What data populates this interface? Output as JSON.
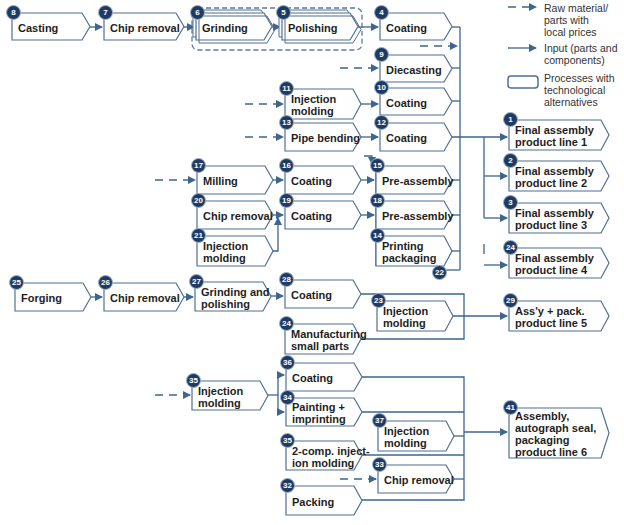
{
  "colors": {
    "line": "#3d6590",
    "badge": "#1f3b63",
    "border": "#4f6f93",
    "dashed_group": "#5a7aa0"
  },
  "legend": {
    "items": [
      {
        "icon": "dashed-arrow-icon",
        "label": "Raw material/\nparts with\nlocal prices"
      },
      {
        "icon": "solid-arrow-icon",
        "label": "Input (parts and\ncomponents)"
      },
      {
        "icon": "double-box-icon",
        "label": "Processes with\ntechnological\nalternatives"
      }
    ]
  },
  "nodes": [
    {
      "id": "n8",
      "num": "8",
      "label": "Casting",
      "x": 12,
      "y": 13,
      "w": 78,
      "h": 27
    },
    {
      "id": "n7",
      "num": "7",
      "label": "Chip removal",
      "x": 104,
      "y": 13,
      "w": 80,
      "h": 27
    },
    {
      "id": "n6",
      "num": "6",
      "label": "Grinding",
      "x": 196,
      "y": 13,
      "w": 76,
      "h": 27,
      "alt": true
    },
    {
      "id": "n5",
      "num": "5",
      "label": "Polishing",
      "x": 282,
      "y": 13,
      "w": 76,
      "h": 27,
      "alt": true
    },
    {
      "id": "n4",
      "num": "4",
      "label": "Coating",
      "x": 380,
      "y": 13,
      "w": 72,
      "h": 27
    },
    {
      "id": "n9",
      "num": "9",
      "label": "Diecasting",
      "x": 380,
      "y": 55,
      "w": 72,
      "h": 27
    },
    {
      "id": "n11",
      "num": "11",
      "label": "Injection\nmolding",
      "x": 285,
      "y": 89,
      "w": 76,
      "h": 30
    },
    {
      "id": "n10",
      "num": "10",
      "label": "Coating",
      "x": 380,
      "y": 88,
      "w": 72,
      "h": 27
    },
    {
      "id": "n13",
      "num": "13",
      "label": "Pipe bending",
      "x": 285,
      "y": 123,
      "w": 76,
      "h": 28
    },
    {
      "id": "n12",
      "num": "12",
      "label": "Coating",
      "x": 380,
      "y": 123,
      "w": 72,
      "h": 28
    },
    {
      "id": "n17",
      "num": "17",
      "label": "Milling",
      "x": 197,
      "y": 166,
      "w": 76,
      "h": 28
    },
    {
      "id": "n16",
      "num": "16",
      "label": "Coating",
      "x": 285,
      "y": 166,
      "w": 76,
      "h": 28
    },
    {
      "id": "n15",
      "num": "15",
      "label": "Pre-assembly",
      "x": 376,
      "y": 166,
      "w": 76,
      "h": 28
    },
    {
      "id": "n20",
      "num": "20",
      "label": "Chip removal",
      "x": 197,
      "y": 201,
      "w": 76,
      "h": 28
    },
    {
      "id": "n19",
      "num": "19",
      "label": "Coating",
      "x": 285,
      "y": 201,
      "w": 76,
      "h": 28
    },
    {
      "id": "n18",
      "num": "18",
      "label": "Pre-assembly",
      "x": 376,
      "y": 201,
      "w": 76,
      "h": 28
    },
    {
      "id": "n21",
      "num": "21",
      "label": "Injection\nmolding",
      "x": 197,
      "y": 236,
      "w": 76,
      "h": 30
    },
    {
      "id": "n14",
      "num": "14",
      "label": "Printing\npackaging",
      "x": 376,
      "y": 236,
      "w": 76,
      "h": 30
    },
    {
      "id": "n25",
      "num": "25",
      "label": "Forging",
      "x": 15,
      "y": 283,
      "w": 76,
      "h": 28
    },
    {
      "id": "n26",
      "num": "26",
      "label": "Chip removal",
      "x": 104,
      "y": 283,
      "w": 80,
      "h": 28
    },
    {
      "id": "n27",
      "num": "27",
      "label": "Grinding and\npolishing",
      "x": 195,
      "y": 282,
      "w": 76,
      "h": 29
    },
    {
      "id": "n28",
      "num": "28",
      "label": "Coating",
      "x": 285,
      "y": 280,
      "w": 76,
      "h": 28
    },
    {
      "id": "n23",
      "num": "23",
      "label": "Injection\nmolding",
      "x": 377,
      "y": 301,
      "w": 76,
      "h": 30
    },
    {
      "id": "n24b",
      "num": "24",
      "label": "Manufacturing\nsmall parts",
      "x": 285,
      "y": 324,
      "w": 76,
      "h": 30
    },
    {
      "id": "n36",
      "num": "36",
      "label": "Coating",
      "x": 286,
      "y": 363,
      "w": 76,
      "h": 28
    },
    {
      "id": "n35a",
      "num": "35",
      "label": "Injection\nmolding",
      "x": 192,
      "y": 381,
      "w": 76,
      "h": 29
    },
    {
      "id": "n34",
      "num": "34",
      "label": "Painting +\nimprinting",
      "x": 286,
      "y": 398,
      "w": 76,
      "h": 28
    },
    {
      "id": "n37",
      "num": "37",
      "label": "Injection\nmolding",
      "x": 378,
      "y": 421,
      "w": 76,
      "h": 30
    },
    {
      "id": "n35b",
      "num": "35",
      "label": "2-comp. inject-\nion molding",
      "x": 286,
      "y": 441,
      "w": 76,
      "h": 29
    },
    {
      "id": "n33",
      "num": "33",
      "label": "Chip removal",
      "x": 378,
      "y": 465,
      "w": 76,
      "h": 28
    },
    {
      "id": "n32",
      "num": "32",
      "label": "Packing",
      "x": 286,
      "y": 486,
      "w": 76,
      "h": 29
    },
    {
      "id": "n1",
      "num": "1",
      "label": "Final assembly\nproduct line 1",
      "x": 509,
      "y": 120,
      "w": 100,
      "h": 30
    },
    {
      "id": "n2",
      "num": "2",
      "label": "Final assembly\nproduct line 2",
      "x": 509,
      "y": 161,
      "w": 100,
      "h": 30
    },
    {
      "id": "n3",
      "num": "3",
      "label": "Final assembly\nproduct line 3",
      "x": 509,
      "y": 203,
      "w": 100,
      "h": 30
    },
    {
      "id": "n24",
      "num": "24",
      "label": "Final assembly\nproduct line 4",
      "x": 509,
      "y": 248,
      "w": 100,
      "h": 30
    },
    {
      "id": "n29",
      "num": "29",
      "label": "Ass'y + pack.\nproduct line 5",
      "x": 509,
      "y": 301,
      "w": 100,
      "h": 30
    },
    {
      "id": "n41",
      "num": "41",
      "label": "Assembly,\nautograph seal,\npackaging\nproduct line 6",
      "x": 509,
      "y": 408,
      "w": 100,
      "h": 50
    }
  ],
  "extra_badges": [
    {
      "num": "22",
      "x": 432,
      "y": 265
    }
  ]
}
